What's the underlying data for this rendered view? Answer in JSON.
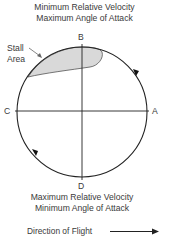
{
  "diagram": {
    "top_caption": {
      "line1": "Minimum Relative Velocity",
      "line2": "Maximum Angle of Attack"
    },
    "bottom_caption": {
      "line1": "Maximum Relative Velocity",
      "line2": "Minimum Angle of Attack"
    },
    "stall_area": {
      "line1": "Stall",
      "line2": "Area",
      "fill_color": "#d9d9d9"
    },
    "points": {
      "top": "B",
      "left": "C",
      "right": "A",
      "bottom": "D"
    },
    "rotation": "clockwise",
    "direction_of_flight": {
      "label": "Direction of Flight",
      "arrow": "right-arrow"
    },
    "colors": {
      "line": "#222222",
      "text": "#3a3a3a",
      "stall_fill": "#d9d9d9"
    }
  }
}
